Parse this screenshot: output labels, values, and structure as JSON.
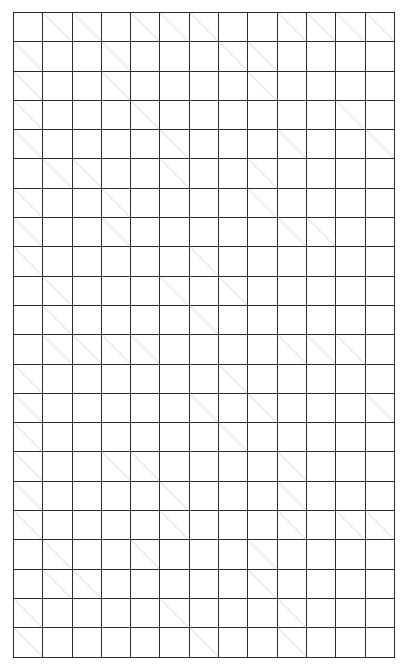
{
  "puzzle": {
    "type": "kakuro",
    "title": "Kakuro Puzzle Grid",
    "columns": 13,
    "rows": 22,
    "colors": {
      "block_fill": "#0d0d0d",
      "open_fill": "#ffffff",
      "grid_line": "#2b2b2b",
      "clue_text": "#ffffff",
      "diagonal_line": "#e8e8e8"
    },
    "legend": {
      "across_position": "top-right",
      "down_position": "bottom-left"
    },
    "cells": [
      [
        {
          "t": "block"
        },
        {
          "t": "clue",
          "down": "16"
        },
        {
          "t": "clue",
          "down": "13"
        },
        {
          "t": "block"
        },
        {
          "t": "clue",
          "down": "9"
        },
        {
          "t": "clue",
          "down": "6"
        },
        {
          "t": "clue",
          "down": "41"
        },
        {
          "t": "block"
        },
        {
          "t": "block"
        },
        {
          "t": "clue",
          "down": "9"
        },
        {
          "t": "clue",
          "down": "35"
        },
        {
          "t": "clue",
          "down": "4"
        },
        {
          "t": "clue",
          "down": "16"
        }
      ],
      [
        {
          "t": "clue",
          "across": "4"
        },
        {
          "t": "open"
        },
        {
          "t": "open"
        },
        {
          "t": "clue",
          "across": "19"
        },
        {
          "t": "open"
        },
        {
          "t": "open"
        },
        {
          "t": "open"
        },
        {
          "t": "clue",
          "down": "36"
        },
        {
          "t": "clue",
          "across": "26"
        },
        {
          "t": "open"
        },
        {
          "t": "open"
        },
        {
          "t": "open"
        },
        {
          "t": "open"
        }
      ],
      [
        {
          "t": "clue",
          "across": "16"
        },
        {
          "t": "open"
        },
        {
          "t": "open"
        },
        {
          "t": "clue",
          "across": "10",
          "down": "20"
        },
        {
          "t": "open"
        },
        {
          "t": "open"
        },
        {
          "t": "open"
        },
        {
          "t": "open"
        },
        {
          "t": "clue",
          "across": "14",
          "down": "4"
        },
        {
          "t": "open"
        },
        {
          "t": "open"
        },
        {
          "t": "open"
        },
        {
          "t": "open"
        }
      ],
      [
        {
          "t": "clue",
          "across": "11"
        },
        {
          "t": "open"
        },
        {
          "t": "open"
        },
        {
          "t": "open"
        },
        {
          "t": "clue",
          "across": "29",
          "down": "31"
        },
        {
          "t": "open"
        },
        {
          "t": "open"
        },
        {
          "t": "open"
        },
        {
          "t": "open"
        },
        {
          "t": "open"
        },
        {
          "t": "open"
        },
        {
          "t": "clue",
          "down": "30"
        },
        {
          "t": "block"
        }
      ],
      [
        {
          "t": "clue",
          "across": "23"
        },
        {
          "t": "open"
        },
        {
          "t": "open"
        },
        {
          "t": "open"
        },
        {
          "t": "open"
        },
        {
          "t": "clue",
          "across": "7"
        },
        {
          "t": "open"
        },
        {
          "t": "open"
        },
        {
          "t": "open"
        },
        {
          "t": "clue",
          "across": "17",
          "down": "16"
        },
        {
          "t": "open"
        },
        {
          "t": "open"
        },
        {
          "t": "clue",
          "down": "37"
        }
      ],
      [
        {
          "t": "block"
        },
        {
          "t": "clue",
          "down": "12"
        },
        {
          "t": "clue",
          "across": "4",
          "down": "34"
        },
        {
          "t": "open"
        },
        {
          "t": "open"
        },
        {
          "t": "clue",
          "across": "12",
          "down": "13"
        },
        {
          "t": "open"
        },
        {
          "t": "open"
        },
        {
          "t": "clue",
          "across": "14"
        },
        {
          "t": "open"
        },
        {
          "t": "open"
        },
        {
          "t": "open"
        },
        {
          "t": "open"
        }
      ],
      [
        {
          "t": "clue",
          "across": "6"
        },
        {
          "t": "open"
        },
        {
          "t": "open"
        },
        {
          "t": "clue",
          "across": "11"
        },
        {
          "t": "open"
        },
        {
          "t": "open"
        },
        {
          "t": "open"
        },
        {
          "t": "open"
        },
        {
          "t": "clue",
          "across": "29",
          "down": "39"
        },
        {
          "t": "open"
        },
        {
          "t": "open"
        },
        {
          "t": "open"
        },
        {
          "t": "open"
        }
      ],
      [
        {
          "t": "clue",
          "across": "8"
        },
        {
          "t": "open"
        },
        {
          "t": "open"
        },
        {
          "t": "clue",
          "across": "27",
          "down": "15"
        },
        {
          "t": "open"
        },
        {
          "t": "open"
        },
        {
          "t": "open"
        },
        {
          "t": "open"
        },
        {
          "t": "open"
        },
        {
          "t": "clue",
          "down": "10"
        },
        {
          "t": "clue",
          "across": "4",
          "down": "8"
        },
        {
          "t": "open"
        },
        {
          "t": "open"
        }
      ],
      [
        {
          "t": "clue",
          "across": "35"
        },
        {
          "t": "open"
        },
        {
          "t": "open"
        },
        {
          "t": "open"
        },
        {
          "t": "open"
        },
        {
          "t": "open"
        },
        {
          "t": "clue",
          "across": "26"
        },
        {
          "t": "open"
        },
        {
          "t": "open"
        },
        {
          "t": "open"
        },
        {
          "t": "open"
        },
        {
          "t": "open"
        },
        {
          "t": "open"
        }
      ],
      [
        {
          "t": "block"
        },
        {
          "t": "clue",
          "across": "24"
        },
        {
          "t": "open"
        },
        {
          "t": "open"
        },
        {
          "t": "open"
        },
        {
          "t": "clue",
          "down": "33"
        },
        {
          "t": "block"
        },
        {
          "t": "clue",
          "across": "16",
          "down": "4"
        },
        {
          "t": "open"
        },
        {
          "t": "open"
        },
        {
          "t": "open"
        },
        {
          "t": "open"
        },
        {
          "t": "open"
        }
      ],
      [
        {
          "t": "block"
        },
        {
          "t": "clue",
          "across": "17"
        },
        {
          "t": "open"
        },
        {
          "t": "open"
        },
        {
          "t": "open"
        },
        {
          "t": "open"
        },
        {
          "t": "clue",
          "across": "36",
          "down": "16"
        },
        {
          "t": "open"
        },
        {
          "t": "open"
        },
        {
          "t": "open"
        },
        {
          "t": "open"
        },
        {
          "t": "open"
        },
        {
          "t": "open"
        }
      ],
      [
        {
          "t": "block"
        },
        {
          "t": "clue",
          "down": "22"
        },
        {
          "t": "clue",
          "down": "31"
        },
        {
          "t": "clue",
          "down": "11"
        },
        {
          "t": "clue",
          "across": "26",
          "down": "20"
        },
        {
          "t": "open"
        },
        {
          "t": "open"
        },
        {
          "t": "open"
        },
        {
          "t": "open"
        },
        {
          "t": "clue",
          "down": "38"
        },
        {
          "t": "clue",
          "down": "9"
        },
        {
          "t": "clue",
          "down": "23"
        },
        {
          "t": "block"
        }
      ],
      [
        {
          "t": "clue",
          "across": "24"
        },
        {
          "t": "open"
        },
        {
          "t": "open"
        },
        {
          "t": "open"
        },
        {
          "t": "open"
        },
        {
          "t": "open"
        },
        {
          "t": "open"
        },
        {
          "t": "clue",
          "down": "29"
        },
        {
          "t": "open"
        },
        {
          "t": "open"
        },
        {
          "t": "open"
        },
        {
          "t": "open"
        },
        {
          "t": "block"
        }
      ],
      [
        {
          "t": "clue",
          "across": "34"
        },
        {
          "t": "open"
        },
        {
          "t": "open"
        },
        {
          "t": "open"
        },
        {
          "t": "open"
        },
        {
          "t": "open"
        },
        {
          "t": "clue",
          "down": "40"
        },
        {
          "t": "block"
        },
        {
          "t": "clue",
          "across": "12",
          "down": "11"
        },
        {
          "t": "open"
        },
        {
          "t": "open"
        },
        {
          "t": "open"
        },
        {
          "t": "clue",
          "down": "8"
        }
      ],
      [
        {
          "t": "clue",
          "across": "21"
        },
        {
          "t": "open"
        },
        {
          "t": "open"
        },
        {
          "t": "open"
        },
        {
          "t": "open"
        },
        {
          "t": "open"
        },
        {
          "t": "open"
        },
        {
          "t": "clue",
          "across": "16",
          "down": "31"
        },
        {
          "t": "open"
        },
        {
          "t": "open"
        },
        {
          "t": "open"
        },
        {
          "t": "open"
        },
        {
          "t": "open"
        }
      ],
      [
        {
          "t": "clue",
          "across": "4"
        },
        {
          "t": "open"
        },
        {
          "t": "open"
        },
        {
          "t": "clue",
          "down": "34"
        },
        {
          "t": "clue",
          "across": "22",
          "down": "7"
        },
        {
          "t": "open"
        },
        {
          "t": "open"
        },
        {
          "t": "open"
        },
        {
          "t": "open"
        },
        {
          "t": "clue",
          "down": "4"
        },
        {
          "t": "open"
        },
        {
          "t": "open"
        },
        {
          "t": "open"
        }
      ],
      [
        {
          "t": "clue",
          "across": "30"
        },
        {
          "t": "open"
        },
        {
          "t": "open"
        },
        {
          "t": "open"
        },
        {
          "t": "open"
        },
        {
          "t": "clue",
          "down": "30"
        },
        {
          "t": "open"
        },
        {
          "t": "open"
        },
        {
          "t": "open"
        },
        {
          "t": "clue",
          "across": "14",
          "down": "19"
        },
        {
          "t": "open"
        },
        {
          "t": "open"
        },
        {
          "t": "open"
        }
      ],
      [
        {
          "t": "clue",
          "across": "11"
        },
        {
          "t": "open"
        },
        {
          "t": "open"
        },
        {
          "t": "open"
        },
        {
          "t": "open"
        },
        {
          "t": "clue",
          "across": "14",
          "down": "15"
        },
        {
          "t": "open"
        },
        {
          "t": "open"
        },
        {
          "t": "open"
        },
        {
          "t": "clue",
          "down": "4"
        },
        {
          "t": "open"
        },
        {
          "t": "clue",
          "down": "16"
        },
        {
          "t": "clue",
          "down": "14"
        }
      ],
      [
        {
          "t": "block"
        },
        {
          "t": "clue",
          "down": "6"
        },
        {
          "t": "open"
        },
        {
          "t": "open"
        },
        {
          "t": "clue",
          "across": "12",
          "down": "21"
        },
        {
          "t": "open"
        },
        {
          "t": "open"
        },
        {
          "t": "open"
        },
        {
          "t": "clue",
          "across": "16",
          "down": "24"
        },
        {
          "t": "open"
        },
        {
          "t": "open"
        },
        {
          "t": "open"
        },
        {
          "t": "open"
        }
      ],
      [
        {
          "t": "block"
        },
        {
          "t": "clue",
          "down": "16"
        },
        {
          "t": "clue",
          "across": "39",
          "down": "4"
        },
        {
          "t": "open"
        },
        {
          "t": "open"
        },
        {
          "t": "open"
        },
        {
          "t": "open"
        },
        {
          "t": "open"
        },
        {
          "t": "clue",
          "across": "13",
          "down": "16"
        },
        {
          "t": "open"
        },
        {
          "t": "open"
        },
        {
          "t": "open"
        },
        {
          "t": "open"
        }
      ],
      [
        {
          "t": "clue",
          "across": "14"
        },
        {
          "t": "open"
        },
        {
          "t": "open"
        },
        {
          "t": "open"
        },
        {
          "t": "open"
        },
        {
          "t": "clue",
          "down": "27"
        },
        {
          "t": "open"
        },
        {
          "t": "open"
        },
        {
          "t": "open"
        },
        {
          "t": "clue",
          "down": "17"
        },
        {
          "t": "open"
        },
        {
          "t": "open"
        },
        {
          "t": "open"
        }
      ],
      [
        {
          "t": "clue",
          "across": "26"
        },
        {
          "t": "open"
        },
        {
          "t": "open"
        },
        {
          "t": "open"
        },
        {
          "t": "open"
        },
        {
          "t": "block"
        },
        {
          "t": "clue",
          "down": "23"
        },
        {
          "t": "open"
        },
        {
          "t": "open"
        },
        {
          "t": "clue",
          "down": "4"
        },
        {
          "t": "open"
        },
        {
          "t": "open"
        },
        {
          "t": "open"
        }
      ]
    ]
  }
}
